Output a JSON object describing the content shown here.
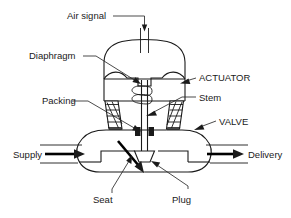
{
  "diagram": {
    "type": "cross-section-schematic",
    "background_color": "#ffffff",
    "line_color": "#1a1a1a",
    "labels": {
      "air_signal": "Air signal",
      "diaphragm": "Diaphragm",
      "packing": "Packing",
      "supply": "Supply",
      "seat": "Seat",
      "plug": "Plug",
      "actuator": "ACTUATOR",
      "stem": "Stem",
      "valve": "VALVE",
      "delivery": "Delivery"
    },
    "components": [
      {
        "name": "air-signal-port",
        "label": "Air signal"
      },
      {
        "name": "actuator-housing",
        "label": "ACTUATOR"
      },
      {
        "name": "diaphragm",
        "label": "Diaphragm"
      },
      {
        "name": "spring",
        "label": ""
      },
      {
        "name": "stem",
        "label": "Stem"
      },
      {
        "name": "packing-left",
        "label": "Packing"
      },
      {
        "name": "packing-right",
        "label": "Packing"
      },
      {
        "name": "valve-body",
        "label": "VALVE"
      },
      {
        "name": "plug",
        "label": "Plug"
      },
      {
        "name": "seat",
        "label": "Seat"
      },
      {
        "name": "supply-port",
        "label": "Supply"
      },
      {
        "name": "delivery-port",
        "label": "Delivery"
      }
    ]
  }
}
